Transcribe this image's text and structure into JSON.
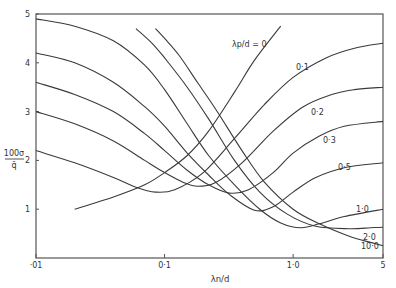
{
  "chart_data": {
    "type": "line",
    "title": "",
    "xlabel": "λn/d",
    "ylabel_num": "100σ",
    "ylabel_den": "q̄",
    "xscale": "log",
    "xlim": [
      0.01,
      5
    ],
    "ylim": [
      0,
      5
    ],
    "grid": false,
    "x_ticks": [
      {
        "v": 0.01,
        "label": "·01"
      },
      {
        "v": 0.1,
        "label": "0·1"
      },
      {
        "v": 1.0,
        "label": "1·0"
      },
      {
        "v": 5,
        "label": "5"
      }
    ],
    "y_ticks": [
      {
        "v": 1,
        "label": "1"
      },
      {
        "v": 2,
        "label": "2"
      },
      {
        "v": 3,
        "label": "3"
      },
      {
        "v": 4,
        "label": "4"
      },
      {
        "v": 5,
        "label": "5"
      }
    ],
    "parameter_annotation": "λp/d = 0",
    "series": [
      {
        "name": "0·1",
        "x": [
          0.01,
          0.02,
          0.04,
          0.06,
          0.085,
          0.12,
          0.2,
          0.35,
          0.6,
          1.0,
          1.8,
          3,
          5
        ],
        "y": [
          2.2,
          1.95,
          1.65,
          1.45,
          1.35,
          1.4,
          1.75,
          2.45,
          3.15,
          3.7,
          4.1,
          4.3,
          4.4
        ]
      },
      {
        "name": "0·2",
        "x": [
          0.01,
          0.02,
          0.04,
          0.07,
          0.1,
          0.14,
          0.18,
          0.25,
          0.4,
          0.7,
          1.2,
          2,
          3,
          5
        ],
        "y": [
          3.0,
          2.75,
          2.4,
          2.0,
          1.75,
          1.55,
          1.47,
          1.55,
          1.95,
          2.6,
          3.1,
          3.35,
          3.45,
          3.5
        ]
      },
      {
        "name": "0·3",
        "x": [
          0.01,
          0.02,
          0.04,
          0.07,
          0.1,
          0.15,
          0.22,
          0.32,
          0.45,
          0.7,
          1.0,
          1.6,
          2.5,
          5
        ],
        "y": [
          3.6,
          3.35,
          3.0,
          2.55,
          2.2,
          1.8,
          1.5,
          1.33,
          1.4,
          1.75,
          2.15,
          2.5,
          2.7,
          2.8
        ]
      },
      {
        "name": "0·5",
        "x": [
          0.01,
          0.02,
          0.04,
          0.07,
          0.1,
          0.15,
          0.22,
          0.32,
          0.5,
          0.7,
          1.0,
          1.5,
          2.5,
          5
        ],
        "y": [
          4.2,
          4.0,
          3.6,
          3.1,
          2.7,
          2.15,
          1.7,
          1.3,
          0.98,
          1.05,
          1.35,
          1.65,
          1.85,
          1.95
        ]
      },
      {
        "name": "1·0",
        "x": [
          0.01,
          0.02,
          0.04,
          0.07,
          0.1,
          0.15,
          0.22,
          0.35,
          0.55,
          0.8,
          1.15,
          1.6,
          2.5,
          5
        ],
        "y": [
          4.9,
          4.75,
          4.45,
          3.95,
          3.45,
          2.75,
          2.1,
          1.5,
          1.0,
          0.72,
          0.62,
          0.7,
          0.85,
          1.0
        ]
      },
      {
        "name": "2·0",
        "x": [
          0.06,
          0.08,
          0.1,
          0.15,
          0.22,
          0.35,
          0.55,
          0.9,
          1.5,
          2.7,
          4,
          5
        ],
        "y": [
          4.7,
          4.4,
          4.1,
          3.5,
          2.85,
          2.0,
          1.35,
          0.9,
          0.65,
          0.6,
          0.62,
          0.63
        ]
      },
      {
        "name": "10·0",
        "x": [
          0.085,
          0.1,
          0.13,
          0.18,
          0.25,
          0.4,
          0.6,
          1.0,
          1.6,
          2.7,
          4,
          5
        ],
        "y": [
          4.7,
          4.5,
          4.15,
          3.6,
          3.05,
          2.2,
          1.55,
          1.0,
          0.7,
          0.45,
          0.32,
          0.25
        ]
      },
      {
        "name": "λp/d = 0",
        "x": [
          0.02,
          0.04,
          0.07,
          0.1,
          0.15,
          0.22,
          0.35,
          0.5,
          0.8
        ],
        "y": [
          1.0,
          1.25,
          1.5,
          1.75,
          2.1,
          2.6,
          3.4,
          4.05,
          4.75
        ]
      }
    ]
  }
}
